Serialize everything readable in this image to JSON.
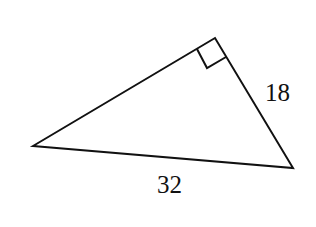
{
  "diagram": {
    "type": "right-triangle",
    "vertices": {
      "left": [
        33,
        146
      ],
      "top": [
        215,
        38
      ],
      "right": [
        293,
        168
      ]
    },
    "right_angle_at": "top",
    "labels": {
      "leg": "18",
      "hypotenuse": "32"
    },
    "colors": {
      "stroke": "#111111",
      "background": "#ffffff"
    }
  }
}
